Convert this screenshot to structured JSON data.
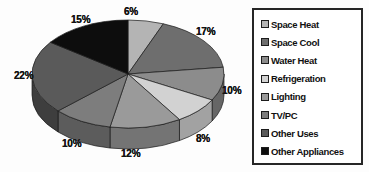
{
  "chart_data": {
    "type": "pie",
    "title": "",
    "subtitle": "",
    "xlabel": "",
    "ylabel": "",
    "grid": false,
    "legend_position": "right",
    "three_d": true,
    "start_angle_deg": 0,
    "direction": "clockwise",
    "categories": [
      "Space Heat",
      "Space Cool",
      "Water Heat",
      "Refrigeration",
      "Lighting",
      "TV/PC",
      "Other Uses",
      "Other Appliances"
    ],
    "values": [
      6,
      17,
      10,
      8,
      12,
      10,
      22,
      15
    ],
    "value_unit": "%",
    "data_labels": [
      "6%",
      "17%",
      "10%",
      "8%",
      "12%",
      "10%",
      "22%",
      "15%"
    ],
    "colors": [
      "#b4b4b4",
      "#6e6e6e",
      "#8c8c8c",
      "#d2d2d2",
      "#9a9a9a",
      "#7d7d7d",
      "#5a5a5a",
      "#0d0d0d"
    ],
    "side_colors": [
      "#8a8a8a",
      "#4c4c4c",
      "#666666",
      "#a2a2a2",
      "#747474",
      "#5c5c5c",
      "#3e3e3e",
      "#070707"
    ],
    "slices": [
      {
        "label": "Space Heat",
        "value": 6,
        "data_label": "6%",
        "color": "#b4b4b4"
      },
      {
        "label": "Space Cool",
        "value": 17,
        "data_label": "17%",
        "color": "#6e6e6e"
      },
      {
        "label": "Water Heat",
        "value": 10,
        "data_label": "10%",
        "color": "#8c8c8c"
      },
      {
        "label": "Refrigeration",
        "value": 8,
        "data_label": "8%",
        "color": "#d2d2d2"
      },
      {
        "label": "Lighting",
        "value": 12,
        "data_label": "12%",
        "color": "#9a9a9a"
      },
      {
        "label": "TV/PC",
        "value": 10,
        "data_label": "10%",
        "color": "#7d7d7d"
      },
      {
        "label": "Other Uses",
        "value": 22,
        "data_label": "22%",
        "color": "#5a5a5a"
      },
      {
        "label": "Other Appliances",
        "value": 15,
        "data_label": "15%",
        "color": "#0d0d0d"
      }
    ]
  },
  "labels": {
    "space_heat": "6%",
    "space_cool": "17%",
    "water_heat": "10%",
    "refrigeration": "8%",
    "lighting": "12%",
    "tv_pc": "10%",
    "other_uses": "22%",
    "other_appliances": "15%"
  },
  "legend": {
    "items": [
      {
        "label": "Space Heat",
        "color": "#b4b4b4"
      },
      {
        "label": "Space Cool",
        "color": "#6e6e6e"
      },
      {
        "label": "Water Heat",
        "color": "#8c8c8c"
      },
      {
        "label": "Refrigeration",
        "color": "#d2d2d2"
      },
      {
        "label": "Lighting",
        "color": "#9a9a9a"
      },
      {
        "label": "TV/PC",
        "color": "#7d7d7d"
      },
      {
        "label": "Other Uses",
        "color": "#5a5a5a"
      },
      {
        "label": "Other Appliances",
        "color": "#0d0d0d"
      }
    ]
  }
}
